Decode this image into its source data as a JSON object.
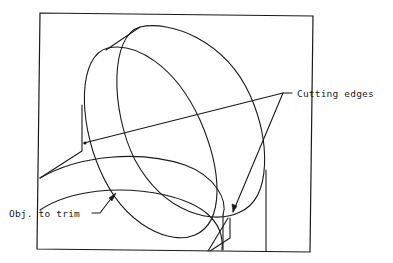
{
  "diagram": {
    "type": "cad-trim-illustration",
    "background": "#ffffff",
    "stroke_color": "#1a1a1a",
    "labels": {
      "cutting_edges": "Cutting edges",
      "object_to_trim": "Obj. to trim"
    },
    "label_positions": {
      "cutting_edges": {
        "x": 297,
        "y": 90
      },
      "object_to_trim": {
        "x": 10,
        "y": 210
      }
    },
    "elements": [
      {
        "name": "viewport-frame",
        "role": "frame"
      },
      {
        "name": "front-ellipse",
        "role": "cutting edge"
      },
      {
        "name": "rear-ellipse",
        "role": "cutting edge"
      },
      {
        "name": "upper-arc",
        "role": "object"
      },
      {
        "name": "lower-arc",
        "role": "object to trim"
      },
      {
        "name": "cutting-edges-leader-upper",
        "role": "leader"
      },
      {
        "name": "cutting-edges-leader-lower",
        "role": "leader"
      },
      {
        "name": "obj-to-trim-leader",
        "role": "leader"
      }
    ]
  }
}
